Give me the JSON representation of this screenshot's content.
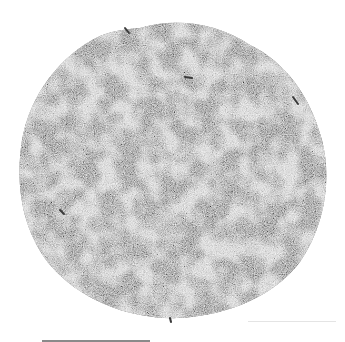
{
  "image": {
    "subject": "pile of fine grey fibrous fragments on white background",
    "background_color": "#ffffff",
    "material_colors": [
      "#6e6e6e",
      "#8c8c8c",
      "#a8a8a8",
      "#3a3a3a"
    ],
    "pile_center": [
      175,
      170
    ],
    "pile_radius_x": 158,
    "pile_radius_y": 150
  },
  "scale_bar": {
    "x": 42,
    "y": 340,
    "width": 108,
    "color": "#8a8a8a"
  },
  "faint_line": {
    "x": 248,
    "y": 321,
    "width": 88
  }
}
